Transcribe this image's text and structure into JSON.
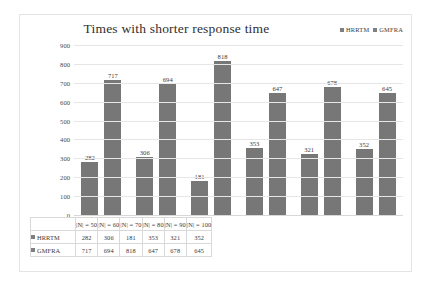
{
  "chart_data": {
    "type": "bar",
    "title": "Times with shorter response time",
    "xlabel": "",
    "ylabel": "",
    "ylim": [
      0,
      900
    ],
    "yticks": [
      900,
      800,
      700,
      600,
      500,
      400,
      300,
      200,
      100,
      0
    ],
    "grid": true,
    "legend_position": "top-right",
    "categories": [
      "|N| = 50",
      "|N| = 60",
      "|N| = 70",
      "|N| = 80",
      "|N| = 90",
      "|N| = 100"
    ],
    "series": [
      {
        "name": "HRRTM",
        "color": "#777777",
        "values": [
          282,
          306,
          181,
          353,
          321,
          352
        ]
      },
      {
        "name": "GMFRA",
        "color": "#777777",
        "values": [
          717,
          694,
          818,
          647,
          678,
          645
        ]
      }
    ]
  },
  "legend": {
    "items": [
      {
        "label": "HRRTM"
      },
      {
        "label": "GMFRA"
      }
    ]
  },
  "data_table": {
    "header": [
      "",
      "|N| = 50",
      "|N| = 60",
      "|N| = 70",
      "|N| = 80",
      "|N| = 90",
      "|N| = 100"
    ],
    "rows": [
      {
        "label": "HRRTM",
        "values": [
          "282",
          "306",
          "181",
          "353",
          "321",
          "352"
        ]
      },
      {
        "label": "GMFRA",
        "values": [
          "717",
          "694",
          "818",
          "647",
          "678",
          "645"
        ]
      }
    ]
  }
}
